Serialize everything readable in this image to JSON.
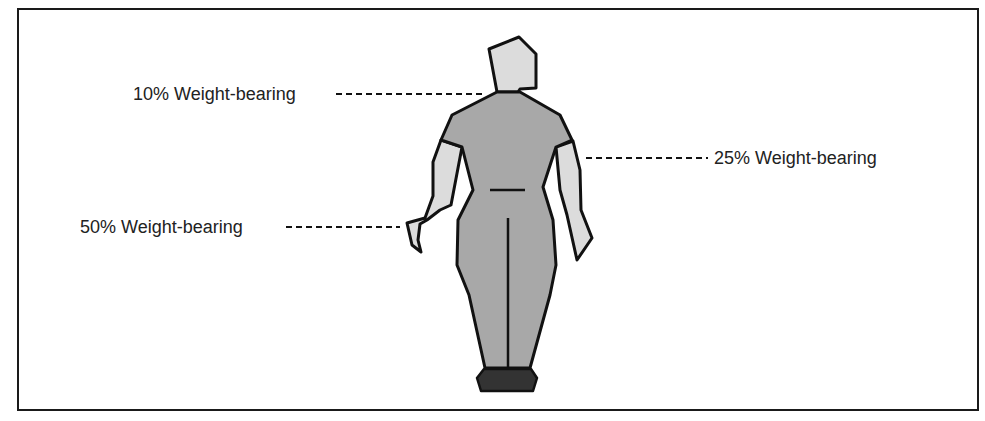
{
  "diagram": {
    "type": "weight-bearing-illustration",
    "labels": [
      {
        "id": "label-10",
        "text": "10% Weight-bearing",
        "side": "left",
        "target": "neck/upper back"
      },
      {
        "id": "label-25",
        "text": "25% Weight-bearing",
        "side": "right",
        "target": "arm"
      },
      {
        "id": "label-50",
        "text": "50% Weight-bearing",
        "side": "left",
        "target": "hand"
      }
    ],
    "colors": {
      "body_fill": "#a8a8a8",
      "limb_fill": "#dcdcdc",
      "feet_fill": "#333333",
      "outline": "#111111",
      "border": "#1a1a1a"
    }
  }
}
